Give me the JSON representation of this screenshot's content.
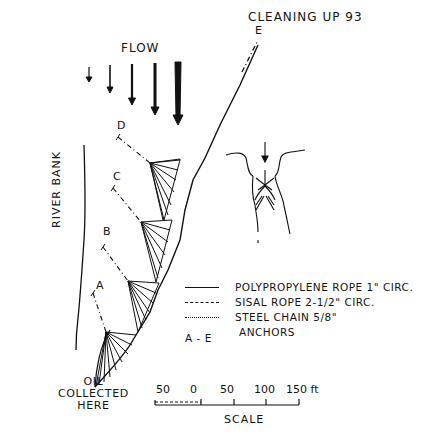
{
  "title": "CLEANING UP 93",
  "flow": {
    "label": "FLOW",
    "arrows": 5
  },
  "labels": {
    "river_bank": "RIVER BANK",
    "oil_collected": [
      "OIL",
      "COLLECTED",
      "HERE"
    ]
  },
  "anchors": [
    "A",
    "B",
    "C",
    "D",
    "E"
  ],
  "legend": [
    {
      "symbol": "solid-line",
      "text": "POLYPROPYLENE ROPE 1\" CIRC."
    },
    {
      "symbol": "dashed-line",
      "text": "SISAL ROPE 2-1/2\" CIRC."
    },
    {
      "symbol": "dash-dot-line",
      "text": "STEEL CHAIN 5/8\""
    },
    {
      "symbol": "A - E",
      "text": "ANCHORS"
    }
  ],
  "scale": {
    "ticks": [
      "50",
      "0",
      "50",
      "100",
      "150 ft"
    ],
    "label": "SCALE"
  },
  "colors": {
    "ink": "#111111",
    "paper": "#ffffff"
  }
}
